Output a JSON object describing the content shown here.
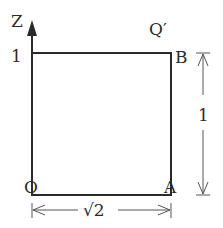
{
  "diagram": {
    "axis_label": "Z",
    "tick_label_z": "1",
    "corner_labels": {
      "origin": "O",
      "bottom_right": "A",
      "top_right": "B",
      "top_right_prime": "Q′"
    },
    "dimensions": {
      "height_label": "1",
      "width_label": "√2"
    },
    "colors": {
      "line": "#2a2a2a",
      "thin_line": "#555555",
      "background": "#ffffff"
    }
  }
}
